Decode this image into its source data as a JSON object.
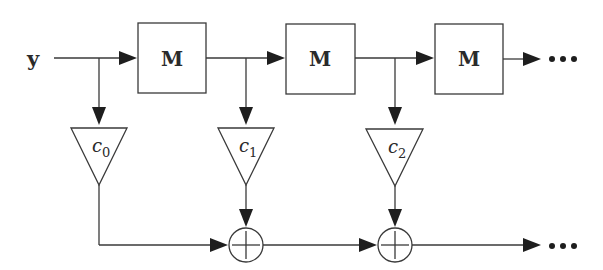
{
  "diagram": {
    "type": "FIR filter / transversal structure block diagram",
    "input_label": "y",
    "delay_blocks": [
      {
        "label": "M"
      },
      {
        "label": "M"
      },
      {
        "label": "M"
      }
    ],
    "gains": [
      {
        "label": "c",
        "sub": "0"
      },
      {
        "label": "c",
        "sub": "1"
      },
      {
        "label": "c",
        "sub": "2"
      }
    ],
    "adders": [
      {
        "symbol": "+"
      },
      {
        "symbol": "+"
      }
    ],
    "continuation_top": "•••",
    "continuation_bottom": "•••",
    "colors": {
      "stroke": "#3a3a3a",
      "fill": "#1e1e1e",
      "background": "#ffffff"
    }
  }
}
